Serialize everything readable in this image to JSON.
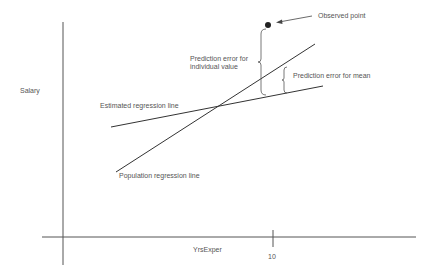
{
  "diagram": {
    "axes": {
      "y_label": "Salary",
      "x_label": "YrsExper",
      "x_tick_label": "10"
    },
    "labels": {
      "observed_point": "Observed point",
      "prediction_error_individual_line1": "Prediction error for",
      "prediction_error_individual_line2": "individual value",
      "prediction_error_mean": "Prediction error for mean",
      "estimated_line": "Estimated regression line",
      "population_line": "Population regression line"
    },
    "colors": {
      "line": "#333333",
      "axis": "#555555",
      "text": "#555555",
      "point": "#222222"
    }
  }
}
